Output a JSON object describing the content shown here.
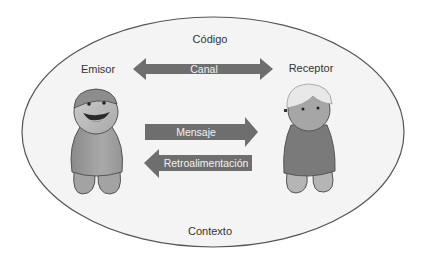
{
  "diagram": {
    "title_top": "Código",
    "title_bottom": "Contexto",
    "sender_label": "Emisor",
    "receiver_label": "Receptor",
    "arrows": {
      "channel": {
        "label": "Canal",
        "direction": "both"
      },
      "message": {
        "label": "Mensaje",
        "direction": "right"
      },
      "feedback": {
        "label": "Retroalimentación",
        "direction": "left"
      }
    },
    "figures": {
      "sender": {
        "name": "sender-figure",
        "expression": "smiling",
        "hair": "cap"
      },
      "receiver": {
        "name": "receiver-figure",
        "expression": "neutral",
        "hair": "white"
      }
    },
    "colors": {
      "ellipse_fill": "#f4f4f4",
      "ellipse_stroke": "#555555",
      "arrow_fill": "#6e6e6e",
      "arrow_text": "#f2f2f2",
      "label_text": "#333333"
    }
  }
}
